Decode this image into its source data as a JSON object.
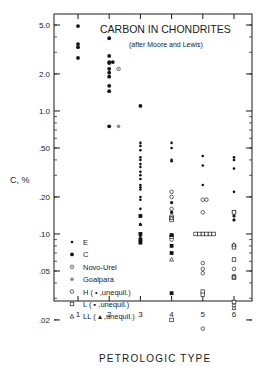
{
  "chart_data": {
    "type": "scatter",
    "title": "CARBON IN CHONDRITES",
    "subtitle": "(after Moore and Lewis)",
    "xlabel": "PETROLOGIC TYPE",
    "ylabel": "C, %",
    "yscale": "log",
    "ylim": [
      0.015,
      6.0
    ],
    "xlim": [
      0.3,
      6.8
    ],
    "x_ticks": [
      "1",
      "2",
      "3",
      "4",
      "5",
      "6"
    ],
    "y_ticks": [
      {
        "value": 5.0,
        "label": "5.0"
      },
      {
        "value": 2.0,
        "label": "2.0"
      },
      {
        "value": 1.0,
        "label": "1.0"
      },
      {
        "value": 0.5,
        "label": ".50"
      },
      {
        "value": 0.2,
        "label": ".20"
      },
      {
        "value": 0.1,
        "label": ".10"
      },
      {
        "value": 0.05,
        "label": ".05"
      },
      {
        "value": 0.02,
        "label": ".02"
      }
    ],
    "grid": false,
    "legend_position": "lower-left inside",
    "legend": [
      {
        "key": "E",
        "label": "E",
        "marker": "small-dot"
      },
      {
        "key": "C",
        "label": "C",
        "marker": "large-dot"
      },
      {
        "key": "NovoUrel",
        "label": "Novo-Urel",
        "marker": "dotted-circle"
      },
      {
        "key": "Goalpara",
        "label": "Goalpara",
        "marker": "gray-circle"
      },
      {
        "key": "H",
        "label": "H  ( • ,unequil.)",
        "marker": "open-circle"
      },
      {
        "key": "L",
        "label": "L  ( ▪ ,unequil.)",
        "marker": "open-square"
      },
      {
        "key": "LL",
        "label": "LL ( ▴ ,unequil.)",
        "marker": "open-triangle"
      }
    ],
    "series": [
      {
        "name": "C",
        "marker": "large-dot",
        "points": [
          [
            1,
            4.9
          ],
          [
            1,
            3.5
          ],
          [
            1,
            3.3
          ],
          [
            1,
            2.7
          ],
          [
            2,
            3.9
          ],
          [
            2,
            2.8
          ],
          [
            2,
            2.5
          ],
          [
            2,
            2.45
          ],
          [
            2,
            2.5
          ],
          [
            2,
            2.2
          ],
          [
            2,
            2.05
          ],
          [
            2,
            1.9
          ],
          [
            2,
            1.6
          ],
          [
            2,
            1.45
          ],
          [
            2,
            0.75
          ],
          [
            3,
            1.1
          ]
        ]
      },
      {
        "name": "NovoUrel",
        "marker": "dotted-circle",
        "points": [
          [
            2.3,
            2.2
          ]
        ]
      },
      {
        "name": "Goalpara",
        "marker": "gray-circle",
        "points": [
          [
            2.3,
            0.75
          ]
        ]
      },
      {
        "name": "E",
        "marker": "small-dot",
        "points": [
          [
            3,
            0.55
          ],
          [
            3,
            0.52
          ],
          [
            3,
            0.48
          ],
          [
            3,
            0.42
          ],
          [
            3,
            0.4
          ],
          [
            3,
            0.37
          ],
          [
            3,
            0.35
          ],
          [
            3,
            0.32
          ],
          [
            3,
            0.3
          ],
          [
            3,
            0.28
          ],
          [
            3,
            0.25
          ],
          [
            3,
            0.24
          ],
          [
            3,
            0.23
          ],
          [
            3,
            0.2
          ],
          [
            3,
            0.19
          ],
          [
            3,
            0.16
          ],
          [
            3,
            0.12
          ],
          [
            3,
            0.095
          ],
          [
            3,
            0.09
          ],
          [
            4,
            0.55
          ],
          [
            4,
            0.5
          ],
          [
            4,
            0.4
          ],
          [
            4,
            0.39
          ],
          [
            5,
            0.43
          ],
          [
            5,
            0.36
          ],
          [
            5,
            0.25
          ],
          [
            6,
            0.42
          ],
          [
            6,
            0.4
          ],
          [
            6,
            0.34
          ],
          [
            6,
            0.22
          ]
        ]
      },
      {
        "name": "H",
        "marker": "open-circle",
        "points": [
          [
            4,
            0.22
          ],
          [
            4,
            0.2
          ],
          [
            4,
            0.16
          ],
          [
            4,
            0.14
          ],
          [
            4,
            0.09
          ],
          [
            5,
            0.19
          ],
          [
            5,
            0.19
          ],
          [
            5,
            0.15
          ],
          [
            5,
            0.058
          ],
          [
            5,
            0.052
          ],
          [
            5,
            0.048
          ],
          [
            5,
            0.017
          ],
          [
            6,
            0.15
          ],
          [
            6,
            0.052
          ],
          [
            6,
            0.026
          ]
        ]
      },
      {
        "name": "H-unequil",
        "marker": "filled-circle",
        "points": [
          [
            4,
            0.18
          ],
          [
            4,
            0.15
          ],
          [
            6,
            0.14
          ],
          [
            6,
            0.13
          ]
        ]
      },
      {
        "name": "L",
        "marker": "open-square",
        "points": [
          [
            4,
            0.135
          ],
          [
            4,
            0.13
          ],
          [
            4,
            0.095
          ],
          [
            4,
            0.02
          ],
          [
            5,
            0.1
          ],
          [
            5,
            0.1
          ],
          [
            5,
            0.1
          ],
          [
            5,
            0.1
          ],
          [
            5,
            0.1
          ],
          [
            5,
            0.1
          ],
          [
            5,
            0.034
          ],
          [
            5,
            0.032
          ],
          [
            6,
            0.15
          ],
          [
            6,
            0.08
          ],
          [
            6,
            0.078
          ],
          [
            6,
            0.062
          ],
          [
            6,
            0.045
          ],
          [
            6,
            0.044
          ],
          [
            6,
            0.028
          ]
        ]
      },
      {
        "name": "L-unequil",
        "marker": "filled-square",
        "points": [
          [
            3,
            0.14
          ],
          [
            3,
            0.1
          ],
          [
            3,
            0.09
          ],
          [
            3,
            0.085
          ],
          [
            4,
            0.098
          ],
          [
            4,
            0.08
          ],
          [
            4,
            0.07
          ],
          [
            4,
            0.033
          ]
        ]
      },
      {
        "name": "LL",
        "marker": "open-triangle",
        "points": [
          [
            4,
            0.135
          ],
          [
            4,
            0.062
          ],
          [
            6,
            0.082
          ],
          [
            6,
            0.045
          ],
          [
            6,
            0.025
          ]
        ]
      },
      {
        "name": "LL-unequil",
        "marker": "filled-triangle",
        "points": [
          [
            3,
            0.12
          ]
        ]
      }
    ]
  }
}
